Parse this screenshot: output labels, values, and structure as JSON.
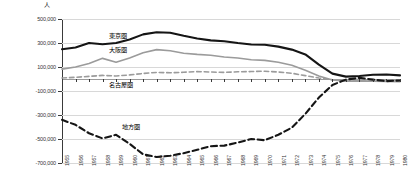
{
  "chart_data": {
    "type": "line",
    "title": "",
    "xlabel": "",
    "ylabel": "人",
    "unit_label": "人",
    "ylim": [
      -700000,
      500000
    ],
    "ytick_values": [
      500000,
      300000,
      100000,
      -100000,
      -300000,
      -500000,
      -700000
    ],
    "ytick_labels": [
      "500,000",
      "300,000",
      "100,000",
      "-100,000",
      "-300,000",
      "-500,000",
      "-700,000"
    ],
    "grid": true,
    "legend_position": "inline-annotations",
    "categories": [
      "1955",
      "1956",
      "1957",
      "1958",
      "1959",
      "1960",
      "1961",
      "1962",
      "1963",
      "1964",
      "1965",
      "1966",
      "1967",
      "1968",
      "1969",
      "1970",
      "1971",
      "1972",
      "1973",
      "1974",
      "1975",
      "1976",
      "1977",
      "1978",
      "1979",
      "1980"
    ],
    "series": [
      {
        "name": "東京圏",
        "style": "solid",
        "color": "#151515",
        "width": 2.1,
        "label_x_year": "1958",
        "values": [
          248000,
          262000,
          300000,
          290000,
          300000,
          330000,
          372000,
          390000,
          385000,
          360000,
          338000,
          322000,
          315000,
          300000,
          288000,
          285000,
          270000,
          245000,
          205000,
          120000,
          45000,
          20000,
          25000,
          35000,
          38000,
          30000
        ]
      },
      {
        "name": "大阪圏",
        "style": "solid",
        "color": "#9b9b9b",
        "width": 1.6,
        "label_x_year": "1958",
        "values": [
          82000,
          100000,
          130000,
          172000,
          140000,
          175000,
          218000,
          245000,
          235000,
          215000,
          205000,
          198000,
          183000,
          175000,
          160000,
          155000,
          140000,
          115000,
          72000,
          25000,
          -8000,
          -18000,
          -16000,
          -18000,
          -20000,
          -22000
        ]
      },
      {
        "name": "名古屋圏",
        "style": "dashed",
        "color": "#9b9b9b",
        "width": 1.6,
        "label_x_year": "1958",
        "values": [
          8000,
          14000,
          22000,
          30000,
          25000,
          34000,
          46000,
          55000,
          52000,
          56000,
          62000,
          58000,
          55000,
          60000,
          62000,
          65000,
          58000,
          48000,
          28000,
          8000,
          -6000,
          -8000,
          -5000,
          -6000,
          -8000,
          -10000
        ]
      },
      {
        "name": "地方圏",
        "style": "dashed",
        "color": "#151515",
        "width": 2.1,
        "label_x_year": "1959",
        "values": [
          -340000,
          -382000,
          -452000,
          -495000,
          -465000,
          -540000,
          -628000,
          -650000,
          -640000,
          -618000,
          -590000,
          -560000,
          -555000,
          -530000,
          -500000,
          -510000,
          -465000,
          -405000,
          -290000,
          -155000,
          -50000,
          -5000,
          10000,
          -5000,
          -18000,
          -12000
        ]
      }
    ]
  }
}
